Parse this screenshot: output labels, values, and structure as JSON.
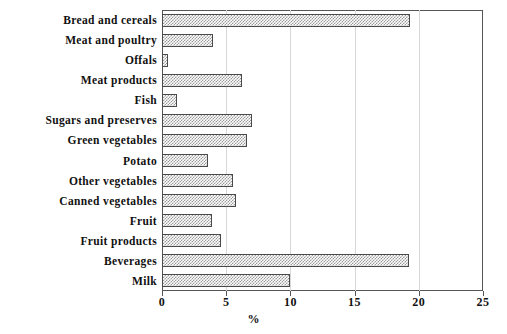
{
  "chart_data": {
    "type": "bar",
    "orientation": "horizontal",
    "title": "",
    "xlabel": "%",
    "ylabel": "",
    "xlim": [
      0,
      25
    ],
    "xticks": [
      0,
      5,
      10,
      15,
      20,
      25
    ],
    "xtick_labels": [
      "0",
      "5",
      "10",
      "15",
      "20",
      "25"
    ],
    "grid": true,
    "grid_axis": "x",
    "legend": false,
    "bar_fill": "crosshatch-gray",
    "bar_edge_color": "#4a4a4a",
    "categories": [
      "Bread and cereals",
      "Meat and poultry",
      "Offals",
      "Meat products",
      "Fish",
      "Sugars and preserves",
      "Green vegetables",
      "Potato",
      "Other vegetables",
      "Canned vegetables",
      "Fruit",
      "Fruit products",
      "Beverages",
      "Milk"
    ],
    "values": [
      19.3,
      4.0,
      0.5,
      6.2,
      1.2,
      7.0,
      6.6,
      3.6,
      5.5,
      5.8,
      3.9,
      4.6,
      19.2,
      10.0
    ]
  }
}
